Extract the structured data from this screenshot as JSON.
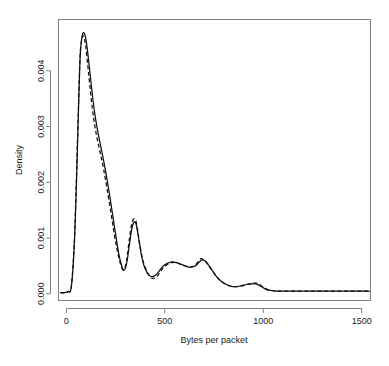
{
  "chart_data": {
    "type": "line",
    "title": "",
    "subtitle": "",
    "xlabel": "Bytes per packet",
    "ylabel": "Density",
    "xlim": [
      -40,
      1545
    ],
    "ylim": [
      -0.00012,
      0.00492
    ],
    "xticks": [
      0,
      500,
      1000,
      1500
    ],
    "xtick_labels": [
      "0",
      "500",
      "1000",
      "1500"
    ],
    "yticks": [
      0.0,
      0.001,
      0.002,
      0.003,
      0.004
    ],
    "ytick_labels": [
      "0.000",
      "0.001",
      "0.002",
      "0.003",
      "0.004"
    ],
    "grid": false,
    "legend": null,
    "annotations": [],
    "series": [
      {
        "name": "density-solid",
        "style": "solid",
        "color": "#111111",
        "x": [
          -30,
          -10,
          10,
          25,
          40,
          50,
          60,
          70,
          80,
          90,
          100,
          110,
          120,
          135,
          150,
          165,
          180,
          195,
          210,
          225,
          240,
          255,
          265,
          275,
          285,
          292,
          300,
          310,
          320,
          330,
          340,
          348,
          355,
          365,
          375,
          385,
          395,
          410,
          425,
          440,
          455,
          470,
          485,
          500,
          515,
          530,
          545,
          560,
          575,
          590,
          605,
          620,
          635,
          650,
          665,
          680,
          692,
          705,
          720,
          735,
          750,
          765,
          785,
          805,
          825,
          845,
          865,
          885,
          905,
          925,
          945,
          960,
          975,
          995,
          1015,
          1035,
          1060,
          1100,
          1150,
          1200,
          1260,
          1320,
          1380,
          1440,
          1500,
          1540
        ],
        "y": [
          2e-05,
          2e-05,
          4e-05,
          0.00012,
          0.00085,
          0.00185,
          0.0031,
          0.00425,
          0.00462,
          0.00468,
          0.00455,
          0.00428,
          0.00396,
          0.00348,
          0.0031,
          0.00281,
          0.00255,
          0.00228,
          0.00198,
          0.00165,
          0.0013,
          0.00096,
          0.00074,
          0.00058,
          0.00046,
          0.00042,
          0.00046,
          0.00062,
          0.00088,
          0.00112,
          0.00126,
          0.00129,
          0.00124,
          0.00104,
          0.00082,
          0.00063,
          0.0005,
          0.00038,
          0.00032,
          0.00031,
          0.00034,
          0.0004,
          0.00047,
          0.00052,
          0.00055,
          0.00057,
          0.00057,
          0.00056,
          0.00054,
          0.00052,
          0.0005,
          0.00048,
          0.00048,
          0.00049,
          0.00053,
          0.00059,
          0.00061,
          0.00059,
          0.00053,
          0.00045,
          0.00037,
          0.0003,
          0.00023,
          0.00018,
          0.00015,
          0.00013,
          0.00013,
          0.00014,
          0.00016,
          0.00017,
          0.00018,
          0.00018,
          0.00016,
          0.00012,
          8e-05,
          6e-05,
          5e-05,
          5e-05,
          5e-05,
          5e-05,
          5e-05,
          5e-05,
          5e-05,
          5e-05,
          5e-05,
          5e-05
        ]
      },
      {
        "name": "density-dashed",
        "style": "dashed",
        "color": "#111111",
        "x": [
          -30,
          -10,
          10,
          25,
          40,
          50,
          60,
          70,
          80,
          88,
          98,
          108,
          118,
          132,
          146,
          160,
          175,
          190,
          205,
          220,
          235,
          250,
          262,
          272,
          282,
          290,
          300,
          310,
          320,
          330,
          340,
          348,
          356,
          366,
          376,
          388,
          400,
          415,
          430,
          445,
          460,
          475,
          490,
          505,
          520,
          535,
          550,
          565,
          580,
          595,
          610,
          625,
          640,
          655,
          670,
          682,
          694,
          708,
          722,
          738,
          754,
          770,
          790,
          810,
          830,
          850,
          870,
          890,
          910,
          930,
          950,
          965,
          980,
          1000,
          1020,
          1040,
          1065,
          1105,
          1155,
          1205,
          1265,
          1325,
          1385,
          1445,
          1500,
          1540
        ],
        "y": [
          2e-05,
          2e-05,
          4e-05,
          0.00013,
          0.00092,
          0.00196,
          0.00318,
          0.00428,
          0.00458,
          0.00462,
          0.00444,
          0.00412,
          0.00378,
          0.00332,
          0.00298,
          0.00272,
          0.00248,
          0.00222,
          0.00192,
          0.0016,
          0.00126,
          0.00093,
          0.00072,
          0.00057,
          0.00046,
          0.00043,
          0.0005,
          0.0007,
          0.00098,
          0.00122,
          0.00133,
          0.00134,
          0.00127,
          0.00105,
          0.00082,
          0.00061,
          0.00048,
          0.00036,
          0.00029,
          0.00028,
          0.00031,
          0.00038,
          0.00046,
          0.00051,
          0.00054,
          0.00056,
          0.00056,
          0.00055,
          0.00053,
          0.00051,
          0.00049,
          0.00048,
          0.00049,
          0.00052,
          0.00058,
          0.00063,
          0.00062,
          0.00058,
          0.00051,
          0.00043,
          0.00035,
          0.00028,
          0.00022,
          0.00017,
          0.00014,
          0.00013,
          0.00013,
          0.00014,
          0.00016,
          0.00018,
          0.00019,
          0.00019,
          0.00017,
          0.00012,
          8e-05,
          6e-05,
          5e-05,
          5e-05,
          5e-05,
          5e-05,
          5e-05,
          5e-05,
          5e-05,
          5e-05,
          5e-05,
          5e-05
        ]
      }
    ]
  },
  "axes": {
    "x_title": "Bytes per packet",
    "y_title": "Density"
  }
}
